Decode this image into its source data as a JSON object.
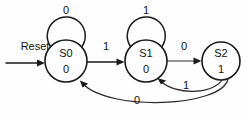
{
  "diagram": {
    "type": "finite-state-machine",
    "title": "",
    "background_color": "#fefefe",
    "line_color": "#1a1a1a",
    "reset": {
      "label": "Reset",
      "target": "S0"
    },
    "states": [
      {
        "id": "S0",
        "name": "S0",
        "output": "0",
        "cx": 66,
        "cy": 61,
        "r": 21
      },
      {
        "id": "S1",
        "name": "S1",
        "output": "0",
        "cx": 146,
        "cy": 61,
        "r": 21
      },
      {
        "id": "S2",
        "name": "S2",
        "output": "1",
        "cx": 221,
        "cy": 61,
        "r": 19
      }
    ],
    "transitions": [
      {
        "from": "S0",
        "to": "S0",
        "label": "0",
        "kind": "self-loop",
        "label_x": 66,
        "label_y": 11
      },
      {
        "from": "S1",
        "to": "S1",
        "label": "1",
        "kind": "self-loop",
        "label_x": 146,
        "label_y": 11
      },
      {
        "from": "S0",
        "to": "S1",
        "label": "1",
        "kind": "straight",
        "label_x": 106,
        "label_y": 47
      },
      {
        "from": "S1",
        "to": "S2",
        "label": "0",
        "kind": "straight",
        "label_x": 184,
        "label_y": 47
      },
      {
        "from": "S2",
        "to": "S1",
        "label": "1",
        "kind": "arc",
        "label_x": 186,
        "label_y": 86
      },
      {
        "from": "S2",
        "to": "S0",
        "label": "0",
        "kind": "arc",
        "label_x": 137,
        "label_y": 101
      }
    ]
  }
}
